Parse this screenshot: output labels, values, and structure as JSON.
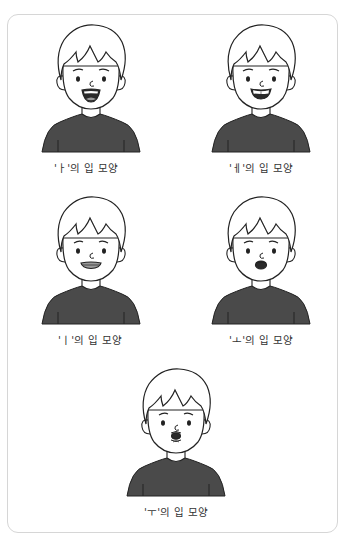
{
  "figures": [
    {
      "id": "a",
      "vowel": "ㅏ",
      "caption": "'ㅏ'의 입 모양",
      "mouth": "open-wide"
    },
    {
      "id": "e",
      "vowel": "ㅔ",
      "caption": "'ㅔ'의 입 모양",
      "mouth": "wide-teeth"
    },
    {
      "id": "i",
      "vowel": "ㅣ",
      "caption": "'ㅣ'의 입 모양",
      "mouth": "flat-spread"
    },
    {
      "id": "o",
      "vowel": "ㅗ",
      "caption": "'ㅗ'의 입 모양",
      "mouth": "round-small"
    },
    {
      "id": "u",
      "vowel": "ㅜ",
      "caption": "'ㅜ'의 입 모양",
      "mouth": "pursed"
    }
  ],
  "colors": {
    "line": "#222222",
    "shirt": "#4a4a4a",
    "skin": "#ffffff",
    "mouth_dark": "#2a2a2a",
    "tongue": "#9a9a9a",
    "border": "#d6d6d6"
  }
}
